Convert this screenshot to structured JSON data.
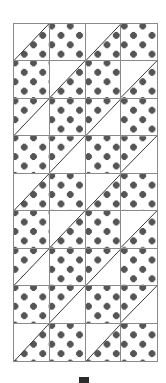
{
  "figure": {
    "columns": 4,
    "rows": 9,
    "colors": {
      "grid_line": "#8a8a8a",
      "dot": "#555555",
      "background": "#ffffff",
      "bottom_mark": "#2b2b2b"
    },
    "cell_types": {
      "full": "fully dotted square",
      "half-lr": "half-square triangle, lower-right dotted, diagonal bottom-left to top-right",
      "half-ul": "half-square triangle, upper-left dotted, diagonal bottom-left to top-right"
    },
    "grid": [
      [
        "half-lr",
        "full",
        "half-lr",
        "full"
      ],
      [
        "full",
        "half-lr",
        "full",
        "half-lr"
      ],
      [
        "half-ul",
        "full",
        "half-ul",
        "full"
      ],
      [
        "full",
        "half-ul",
        "full",
        "half-ul"
      ],
      [
        "half-lr",
        "full",
        "half-lr",
        "full"
      ],
      [
        "full",
        "half-lr",
        "full",
        "half-lr"
      ],
      [
        "half-ul",
        "full",
        "half-ul",
        "full"
      ],
      [
        "full",
        "half-ul",
        "full",
        "half-ul"
      ],
      [
        "half-lr",
        "full",
        "half-lr",
        "full"
      ]
    ]
  },
  "bottom_mark": {
    "icon": "dash-mark-icon",
    "label": ""
  }
}
